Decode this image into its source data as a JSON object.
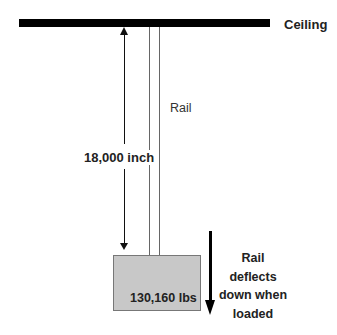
{
  "diagram": {
    "ceiling_label": "Ceiling",
    "rail_label": "Rail",
    "dimension_label": "18,000 inch",
    "load_label": "130,160 lbs",
    "deflection_label_lines": [
      "Rail deflects",
      "down when",
      "loaded"
    ],
    "colors": {
      "ceiling": "#000000",
      "rail": "#666666",
      "load_box_fill": "#c8c8c8",
      "load_box_border": "#777777",
      "text": "#222222"
    }
  }
}
